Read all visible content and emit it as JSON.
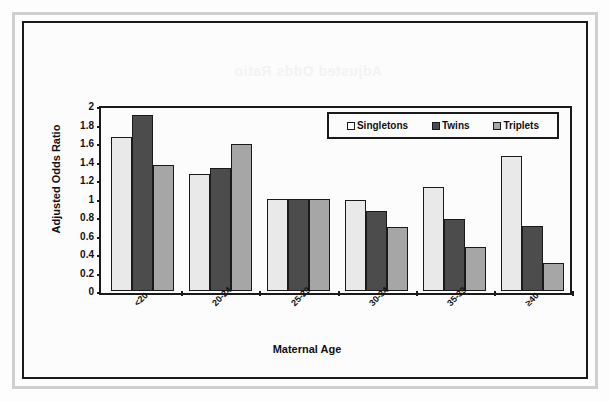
{
  "figure": {
    "bleed_through_artifact": "Adjusted Odds Ratio"
  },
  "chart_data": {
    "type": "bar",
    "title": "",
    "xlabel": "Maternal Age",
    "ylabel": "Adjusted Odds Ratio",
    "categories": [
      "<20",
      "20-24",
      "25-29",
      "30-34",
      "35-39",
      "≥40"
    ],
    "series": [
      {
        "name": "Singletons",
        "color": "#e9e9e9",
        "values": [
          1.67,
          1.26,
          1.0,
          0.98,
          1.12,
          1.46
        ]
      },
      {
        "name": "Twins",
        "color": "#4c4c4c",
        "values": [
          1.9,
          1.33,
          1.0,
          0.86,
          0.78,
          0.7
        ]
      },
      {
        "name": "Triplets",
        "color": "#a6a6a6",
        "values": [
          1.36,
          1.59,
          1.0,
          0.69,
          0.48,
          0.3
        ]
      }
    ],
    "ylim": [
      0,
      2
    ],
    "ytick_labels": [
      "2",
      "1.8",
      "1.6",
      "1.4",
      "1.2",
      "1",
      "0.8",
      "0.6",
      "0.4",
      "0.2",
      "0"
    ],
    "ytick_values": [
      2,
      1.8,
      1.6,
      1.4,
      1.2,
      1,
      0.8,
      0.6,
      0.4,
      0.2,
      0
    ],
    "grid": false,
    "legend_position": "top-right",
    "legend_entries": [
      "Singletons",
      "Twins",
      "Triplets"
    ]
  }
}
